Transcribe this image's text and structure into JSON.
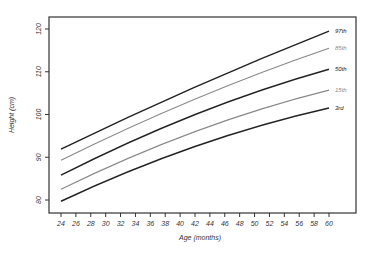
{
  "chart_data": {
    "type": "line",
    "title": "",
    "xlabel": "Age (months)",
    "ylabel": "Height (cm)",
    "xlim": [
      24,
      60
    ],
    "ylim": [
      78,
      123
    ],
    "x_ticks": [
      24,
      26,
      28,
      30,
      32,
      34,
      36,
      38,
      40,
      42,
      44,
      46,
      48,
      50,
      52,
      54,
      56,
      58,
      60
    ],
    "y_ticks": [
      80,
      90,
      100,
      110,
      120
    ],
    "grid": false,
    "legend": "inline labels at right end of lines",
    "x": [
      24,
      42,
      60
    ],
    "series": [
      {
        "name": "97th",
        "values": [
          91.9,
          106.4,
          119.5
        ],
        "color": "#222222",
        "width": 1.5
      },
      {
        "name": "85th",
        "values": [
          89.3,
          103.6,
          115.5
        ],
        "color": "#888888",
        "width": 1.1
      },
      {
        "name": "50th",
        "values": [
          85.8,
          100.0,
          110.6
        ],
        "color": "#222222",
        "width": 1.5
      },
      {
        "name": "15th",
        "values": [
          82.5,
          96.0,
          105.7
        ],
        "color": "#888888",
        "width": 1.1
      },
      {
        "name": "3rd",
        "values": [
          79.7,
          92.5,
          101.5
        ],
        "color": "#222222",
        "width": 1.5
      }
    ]
  },
  "plot": {
    "left": 49,
    "top": 17,
    "right": 356,
    "bottom": 213,
    "x0px": 61,
    "x1px": 329,
    "y80px": 200,
    "y120px": 29
  }
}
